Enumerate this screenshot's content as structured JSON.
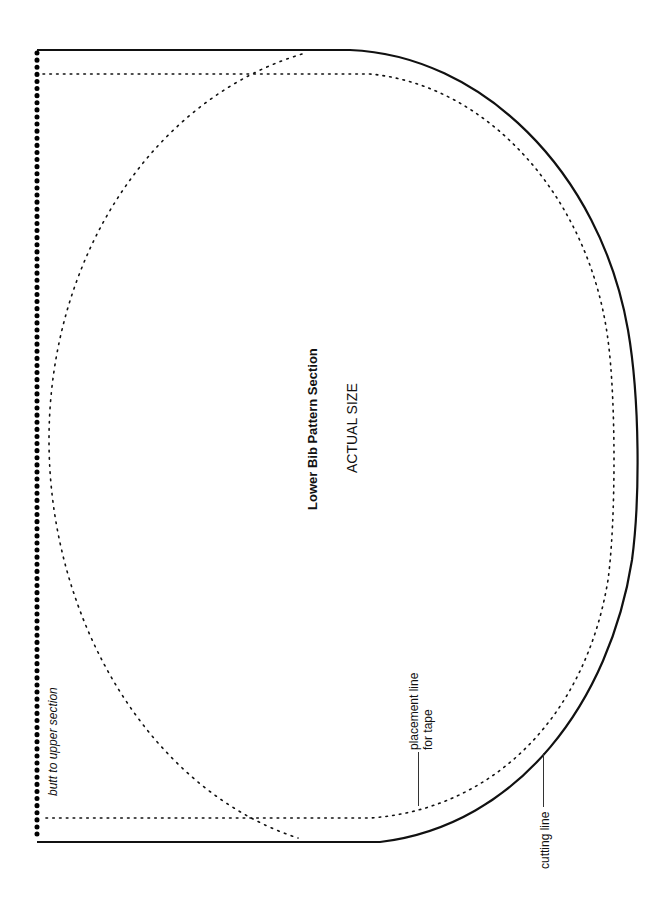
{
  "pattern": {
    "title": "Lower Bib Pattern Section",
    "scale_label": "ACTUAL SIZE",
    "edge_label": "butt to upper section",
    "placement_label_line1": "placement line",
    "placement_label_line2": "for tape",
    "cutting_label": "cutting line"
  },
  "colors": {
    "ink": "#111111",
    "background": "#ffffff"
  }
}
